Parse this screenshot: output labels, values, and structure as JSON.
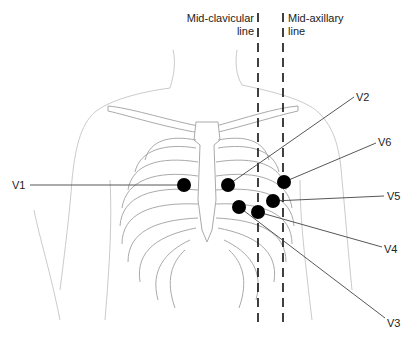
{
  "reference_lines": [
    {
      "id": "mid-clavicular",
      "label_line1": "Mid-clavicular",
      "label_line2": "line",
      "x": 258
    },
    {
      "id": "mid-axillary",
      "label_line1": "Mid-axillary",
      "label_line2": "line",
      "x": 283
    }
  ],
  "electrodes": [
    {
      "lead": "V1",
      "x": 184,
      "y": 185,
      "label_x": 12,
      "label_y": 179
    },
    {
      "lead": "V2",
      "x": 228,
      "y": 185,
      "label_x": 356,
      "label_y": 92
    },
    {
      "lead": "V3",
      "x": 239,
      "y": 207,
      "label_x": 387,
      "label_y": 318
    },
    {
      "lead": "V4",
      "x": 258,
      "y": 212,
      "label_x": 384,
      "label_y": 244
    },
    {
      "lead": "V5",
      "x": 273,
      "y": 201,
      "label_x": 387,
      "label_y": 191
    },
    {
      "lead": "V6",
      "x": 284,
      "y": 182,
      "label_x": 378,
      "label_y": 137
    }
  ],
  "colors": {
    "electrode": "#000000",
    "leader_line": "#444444",
    "anatomy_outline": "#bdbdbd",
    "dashed_line": "#111111"
  }
}
